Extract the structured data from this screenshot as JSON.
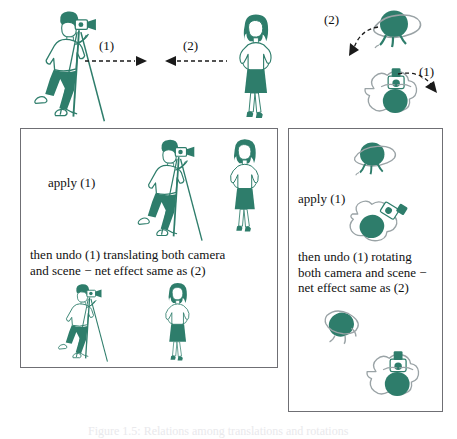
{
  "figure": {
    "colors": {
      "ink_teal": "#2e7d6b",
      "ink_teal_dark": "#276357",
      "outline_gray": "#9aa3a6",
      "panel_border": "#6f6f74",
      "text": "#111111",
      "arrow": "#1a1a1a"
    },
    "top_row": {
      "transform_1_label": "(1)",
      "transform_2_label": "(2)",
      "rotation_2_label": "(2)",
      "rotation_1_label": "(1)",
      "photographer_alt": "photographer-with-tripod-camera",
      "subject_alt": "standing-woman-subject",
      "globe_alt": "globe-scene-object",
      "camera_globe_alt": "camera-viewing-globe"
    },
    "left_panel": {
      "apply_label": "apply (1)",
      "undo_text": "then undo (1) translating both camera\nand scene − net effect same as (2)",
      "top_scene_alt": "photographer-and-subject-after-apply",
      "bottom_scene_alt": "photographer-and-subject-after-undo"
    },
    "right_panel": {
      "apply_label": "apply (1)",
      "undo_text": "then undo (1) rotating\nboth camera and scene −\nnet effect same as (2)",
      "top_scene_alt": "globe-after-apply",
      "mid_scene_alt": "camera-globe-after-apply",
      "bottom_scene_a_alt": "globe-after-undo",
      "bottom_scene_b_alt": "camera-globe-after-undo"
    },
    "caption": "Figure 1.5: Relations among translations and rotations"
  }
}
